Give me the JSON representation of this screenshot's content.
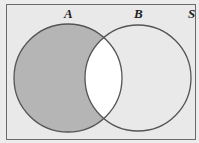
{
  "diagram": {
    "type": "venn",
    "universe_label": "S",
    "sets": [
      {
        "label": "A",
        "cx": 68,
        "cy": 78,
        "r": 54,
        "label_x": 64,
        "label_y": 18
      },
      {
        "label": "B",
        "cx": 138,
        "cy": 78,
        "r": 53,
        "label_x": 134,
        "label_y": 18
      }
    ],
    "shaded_region": "A minus B",
    "universe_label_pos": {
      "x": 189,
      "y": 18
    },
    "colors": {
      "background": "#ececec",
      "universe_fill": "#e9e9e9",
      "shaded": "#b5b5b5",
      "intersection": "#ffffff",
      "stroke": "#555555",
      "frame": "#6a6a6a"
    }
  }
}
